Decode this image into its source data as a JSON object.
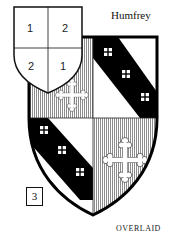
{
  "title": "Humfrey",
  "figure_number": "3",
  "footer_text": "OVERLAID",
  "key_shield": {
    "quarters": [
      "1",
      "2",
      "2",
      "1"
    ]
  },
  "arms": {
    "quarter_1": "bend sinister of crosses on white (bend with 3 squares)",
    "quarter_2": "cross bottony on hatched field",
    "colors": {
      "ink": "#111111",
      "hatch": "#9a9a9a",
      "field": "#ffffff"
    }
  }
}
